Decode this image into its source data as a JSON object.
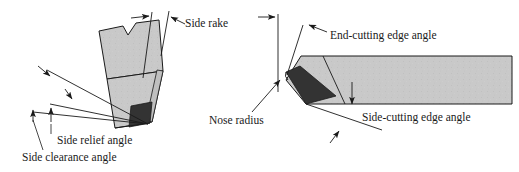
{
  "figure": {
    "background_color": "#ffffff",
    "line_color": "#1a1a1a",
    "body_fill_color": "#c9c9c9",
    "insert_fill_color": "#333333",
    "text_color": "#1a1a1a"
  },
  "labels": {
    "side_rake": "Side rake",
    "side_relief_angle": "Side relief angle",
    "side_clearance_angle": "Side clearance angle",
    "nose_radius": "Nose radius",
    "end_cutting_edge_angle": "End-cutting edge angle",
    "side_cutting_edge_angle": "Side-cutting edge angle"
  },
  "views": {
    "left": {
      "name": "end-view-tilted-tool",
      "features": [
        "side-rake",
        "side-relief-angle",
        "side-clearance-angle"
      ]
    },
    "right": {
      "name": "top-view-tool",
      "features": [
        "nose-radius",
        "end-cutting-edge-angle",
        "side-cutting-edge-angle"
      ]
    }
  }
}
